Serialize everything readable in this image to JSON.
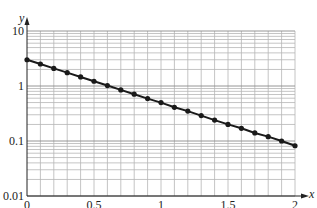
{
  "chart_data": {
    "type": "scatter",
    "connected": true,
    "title": "",
    "xlabel": "x",
    "ylabel": "y",
    "xscale": "linear",
    "yscale": "log",
    "xlim": [
      0,
      2
    ],
    "ylim": [
      0.01,
      10
    ],
    "grid": true,
    "x_major_ticks": [
      0,
      0.5,
      1,
      1.5,
      2
    ],
    "x_tick_labels": [
      "0",
      "0.5",
      "1",
      "1.5",
      "2"
    ],
    "x_minor_step": 0.1,
    "y_major_ticks": [
      0.01,
      0.1,
      1,
      10
    ],
    "y_tick_labels": [
      "0.01",
      "0.1",
      "1",
      "10"
    ],
    "y_minor_ticks_per_decade": [
      2,
      3,
      4,
      5,
      6,
      7,
      8,
      9
    ],
    "values_are_estimated": true,
    "estimation_note": "Anchors read from the image: y about 3 at x=0, about 0.5 at x=1, about 0.08 at x=2. All 21 points were then generated from the fitted curve y = 3e^(-1.8x) and rounded; intermediate points are not individual readings.",
    "series": [
      {
        "name": "data",
        "x": [
          0,
          0.1,
          0.2,
          0.3,
          0.4,
          0.5,
          0.6,
          0.7,
          0.8,
          0.9,
          1.0,
          1.1,
          1.2,
          1.3,
          1.4,
          1.5,
          1.6,
          1.7,
          1.8,
          1.9,
          2.0
        ],
        "y": [
          3.0,
          2.51,
          2.09,
          1.75,
          1.46,
          1.22,
          1.02,
          0.85,
          0.71,
          0.59,
          0.5,
          0.41,
          0.35,
          0.29,
          0.24,
          0.2,
          0.17,
          0.14,
          0.12,
          0.1,
          0.082
        ],
        "color": "#1a1a1a"
      }
    ],
    "colors": {
      "grid": "#b5b5b5",
      "axis": "#222222",
      "line": "#1a1a1a"
    }
  }
}
